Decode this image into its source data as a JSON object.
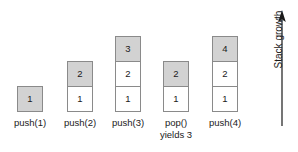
{
  "figure": {
    "type": "stack-operation-diagram",
    "background_color": "#ffffff",
    "filled_color": "#d2d2d2",
    "empty_color": "#ffffff",
    "border_color": "#8a8a8a",
    "text_color": "#1a1a1a"
  },
  "growth": {
    "label": "Stack growth",
    "direction": "up",
    "icon": "up-arrow-icon"
  },
  "columns": [
    {
      "id": "push-1",
      "label_lines": [
        "push(1)"
      ],
      "cells": [
        {
          "value": "1",
          "filled": true
        }
      ]
    },
    {
      "id": "push-2",
      "label_lines": [
        "push(2)"
      ],
      "cells": [
        {
          "value": "1",
          "filled": false
        },
        {
          "value": "2",
          "filled": true
        }
      ]
    },
    {
      "id": "push-3",
      "label_lines": [
        "push(3)"
      ],
      "cells": [
        {
          "value": "1",
          "filled": false
        },
        {
          "value": "2",
          "filled": false
        },
        {
          "value": "3",
          "filled": true
        }
      ]
    },
    {
      "id": "pop",
      "label_lines": [
        "pop()",
        "yields 3"
      ],
      "cells": [
        {
          "value": "1",
          "filled": false
        },
        {
          "value": "2",
          "filled": true
        }
      ]
    },
    {
      "id": "push-4",
      "label_lines": [
        "push(4)"
      ],
      "cells": [
        {
          "value": "1",
          "filled": false
        },
        {
          "value": "2",
          "filled": false
        },
        {
          "value": "4",
          "filled": true
        }
      ]
    }
  ],
  "layout": {
    "column_left_positions": [
      17,
      67,
      115,
      163,
      212
    ]
  }
}
